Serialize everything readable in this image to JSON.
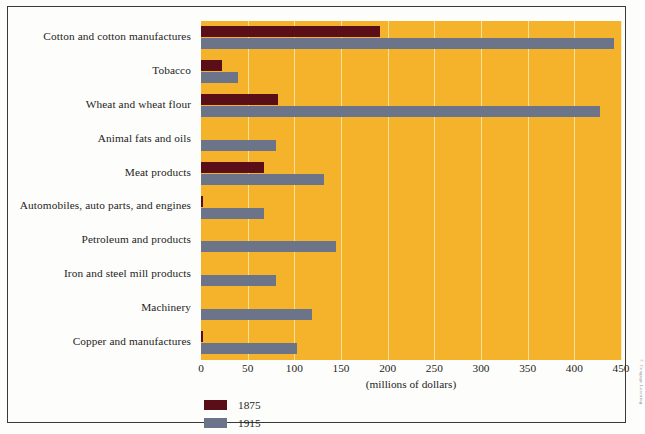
{
  "chart_data": {
    "type": "bar",
    "orientation": "horizontal",
    "title": "",
    "xlabel": "(millions of dollars)",
    "ylabel": "",
    "xlim": [
      0,
      450
    ],
    "xticks": [
      0,
      50,
      100,
      150,
      200,
      250,
      300,
      350,
      400,
      450
    ],
    "xtick_labels": [
      "0",
      "50",
      "100",
      "150",
      "200",
      "250",
      "300",
      "350",
      "400",
      "450"
    ],
    "grid": true,
    "grid_axis": "x",
    "legend_position": "bottom-left",
    "categories": [
      "Cotton and cotton manufactures",
      "Tobacco",
      "Wheat and wheat flour",
      "Animal fats and oils",
      "Meat products",
      "Automobiles, auto parts, and engines",
      "Petroleum and products",
      "Iron and steel mill products",
      "Machinery",
      "Copper and manufactures"
    ],
    "series": [
      {
        "name": "1875",
        "color": "#5a0e18",
        "values": [
          192,
          22,
          82,
          0,
          68,
          2,
          0,
          0,
          0,
          2
        ]
      },
      {
        "name": "1915",
        "color": "#6b7489",
        "values": [
          443,
          40,
          428,
          80,
          132,
          68,
          145,
          80,
          119,
          103
        ]
      }
    ]
  },
  "axis": {
    "x_title": "(millions of dollars)"
  },
  "legend": {
    "entries": [
      {
        "label": "1875",
        "color": "#5a0e18"
      },
      {
        "label": "1915",
        "color": "#6b7489"
      }
    ]
  },
  "credit": {
    "text": "© Cengage Learning"
  },
  "colors": {
    "plot_background": "#f5b32b",
    "gridline": "#fbe8b0",
    "page_background": "#fdfdfb",
    "frame_border": "#3a3a3a",
    "text": "#1d1d1d",
    "series_1875": "#5a0e18",
    "series_1915": "#6b7489"
  }
}
